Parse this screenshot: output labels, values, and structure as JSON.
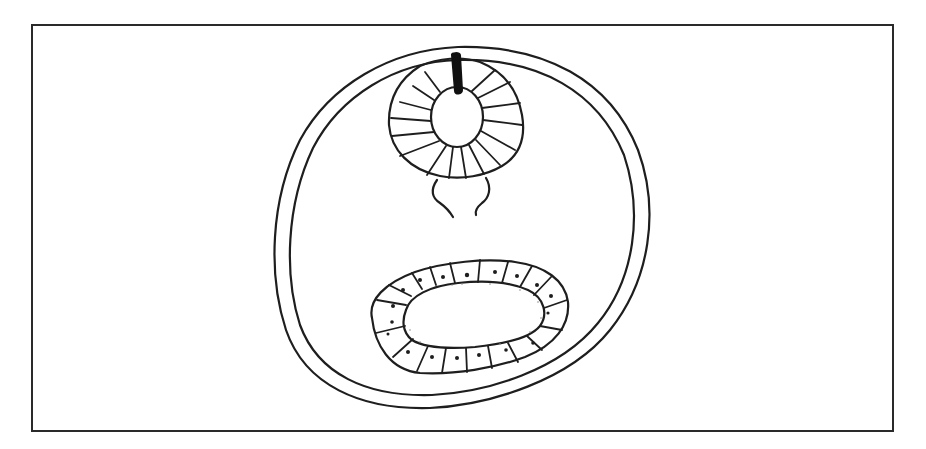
{
  "diagram": {
    "type": "biological cross-section line drawing",
    "frame": {
      "x": 32,
      "y": 25,
      "width": 861,
      "height": 406,
      "stroke": "#2a2a2a"
    },
    "stroke_color": "#1e1e1e",
    "background": "#ffffff",
    "parts": [
      {
        "id": "body-wall",
        "description": "double-walled outer cuticle ellipse"
      },
      {
        "id": "pharynx",
        "description": "radially striated muscular bulb with central lumen, top"
      },
      {
        "id": "pharynx-canal",
        "description": "dark solid canal entering lumen from top"
      },
      {
        "id": "nerve-tissue",
        "description": "paired wavy lines below pharynx"
      },
      {
        "id": "intestine",
        "description": "oval ring of nucleated epithelial cells surrounding lumen, bottom"
      }
    ],
    "intestine_cell_count": 20
  }
}
